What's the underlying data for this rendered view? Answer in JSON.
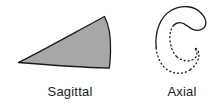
{
  "figure": {
    "type": "anatomical-plane-diagram",
    "background_color": "#ffffff",
    "width": 224,
    "height": 109
  },
  "panels": [
    {
      "id": "sagittal",
      "caption": "Sagittal",
      "shape_name": "wedge-outline",
      "description": "Filled curved wedge / fan shape, gray fill with dark outline",
      "fill_color": "#a8a8a8",
      "stroke_color": "#1a1a1a",
      "stroke_width": 1.3,
      "line_style": "solid"
    },
    {
      "id": "axial",
      "caption": "Axial",
      "shape_name": "c-spiral-outline",
      "description": "Open C-shaped spiral curve, upper half solid stroke, lower half dotted stroke",
      "fill_color": "none",
      "stroke_color": "#1a1a1a",
      "stroke_width": 1.3,
      "line_style": "solid-top-dotted-bottom",
      "dash_pattern": "1 3"
    }
  ]
}
